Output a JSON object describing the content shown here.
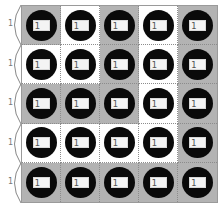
{
  "board": {
    "rows": 5,
    "cols": 5,
    "colors": {
      "gray": "#b3b3b3",
      "white": "#ffffff",
      "circle": "#0a0a0a"
    },
    "cells": [
      [
        "gray",
        "white",
        "gray",
        "white",
        "gray"
      ],
      [
        "white",
        "white",
        "gray",
        "white",
        "gray"
      ],
      [
        "gray",
        "gray",
        "gray",
        "white",
        "gray"
      ],
      [
        "white",
        "white",
        "white",
        "white",
        "gray"
      ],
      [
        "gray",
        "gray",
        "gray",
        "gray",
        "gray"
      ]
    ],
    "tile_label": "1",
    "icon": "circle-with-card-icon"
  },
  "row_brackets": [
    {
      "label": "1"
    },
    {
      "label": "1"
    },
    {
      "label": "1"
    },
    {
      "label": "1"
    },
    {
      "label": "1"
    }
  ]
}
